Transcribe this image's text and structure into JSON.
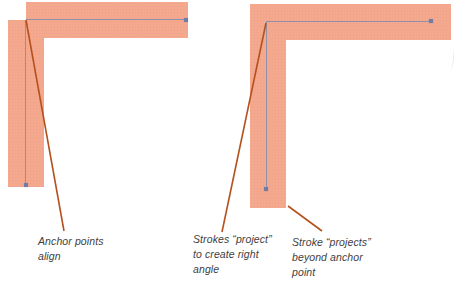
{
  "diagram": {
    "labels": {
      "left": {
        "lines": [
          "Anchor points",
          "align"
        ]
      },
      "middle": {
        "lines": [
          "Strokes “project”",
          "to create right",
          "angle"
        ]
      },
      "right": {
        "lines": [
          "Stroke “projects”",
          "beyond anchor",
          "point"
        ]
      }
    },
    "colors": {
      "stroke_fill": "#f4a88e",
      "path_line": "#8d91ab",
      "anchor_point": "#6f7ca3",
      "callout_line": "#b5511d",
      "label_text": "#3f3e3e"
    }
  }
}
